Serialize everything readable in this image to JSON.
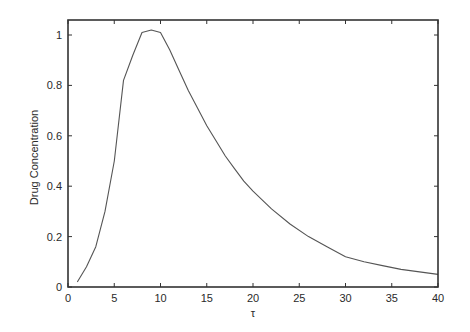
{
  "chart_data": {
    "type": "line",
    "title": "",
    "xlabel": "τ",
    "ylabel": "Drug Concentration",
    "xlim": [
      0,
      40
    ],
    "ylim": [
      0,
      1.05
    ],
    "xticks": [
      0,
      5,
      10,
      15,
      20,
      25,
      30,
      35,
      40
    ],
    "yticks": [
      0,
      0.2,
      0.4,
      0.6,
      0.8,
      1
    ],
    "ytick_labels": [
      "0",
      "0.2",
      "0.4",
      "0.6",
      "0.8",
      "1"
    ],
    "xtick_labels": [
      "0",
      "5",
      "10",
      "15",
      "20",
      "25",
      "30",
      "35",
      "40"
    ],
    "grid": false,
    "legend": null,
    "series": [
      {
        "name": "Drug Concentration",
        "color": "#555555",
        "x": [
          1,
          2,
          3,
          4,
          5,
          6,
          7,
          8,
          9,
          10,
          11,
          12,
          13,
          14,
          15,
          16,
          17,
          18,
          19,
          20,
          22,
          24,
          26,
          28,
          30,
          32,
          34,
          36,
          38,
          40
        ],
        "y": [
          0.02,
          0.08,
          0.16,
          0.3,
          0.5,
          0.82,
          0.92,
          1.01,
          1.02,
          1.01,
          0.94,
          0.86,
          0.78,
          0.71,
          0.64,
          0.58,
          0.52,
          0.47,
          0.42,
          0.38,
          0.31,
          0.25,
          0.2,
          0.16,
          0.12,
          0.1,
          0.085,
          0.07,
          0.06,
          0.05
        ]
      }
    ]
  },
  "colors": {
    "axis": "#333333",
    "line": "#555555",
    "background": "#ffffff"
  }
}
